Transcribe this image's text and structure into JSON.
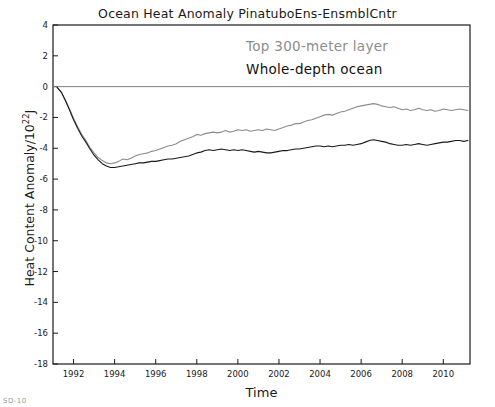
{
  "chart_data": {
    "type": "line",
    "title": "Ocean Heat Anomaly PinatuboEns-EnsmblCntr",
    "xlabel": "Time",
    "ylabel": "Heat Content Anomaly/10",
    "ylabel_exponent": "22",
    "ylabel_unit": "J",
    "xlim": [
      1991.0,
      2011.3
    ],
    "ylim": [
      -18,
      4
    ],
    "grid": false,
    "legend_position": "inside-upper-right-annotations",
    "xticks": [
      1992,
      1994,
      1996,
      1998,
      2000,
      2002,
      2004,
      2006,
      2008,
      2010
    ],
    "xtick_labels": [
      "1992",
      "1994",
      "1996",
      "1998",
      "2000",
      "2002",
      "2004",
      "2006",
      "2008",
      "2010"
    ],
    "yticks": [
      4,
      2,
      0,
      -2,
      -4,
      -6,
      -8,
      -10,
      -12,
      -14,
      -16,
      -18
    ],
    "ytick_labels": [
      "4",
      "2",
      "0",
      "-2",
      "-4",
      "-6",
      "-8",
      "-10",
      "-12",
      "-14",
      "-16",
      "-18"
    ],
    "zero_line": 0,
    "zero_line_color": "#808080",
    "annotations": [
      {
        "text": "Top 300-meter layer",
        "color": "#8c8c8c"
      },
      {
        "text": "Whole-depth ocean",
        "color": "#111111"
      }
    ],
    "series": [
      {
        "name": "Top 300-meter layer",
        "color": "#8c8c8c",
        "x": [
          1991.2,
          1991.4,
          1991.6,
          1991.8,
          1992.0,
          1992.2,
          1992.4,
          1992.6,
          1992.8,
          1993.0,
          1993.2,
          1993.4,
          1993.6,
          1993.8,
          1994.0,
          1994.2,
          1994.4,
          1994.6,
          1994.8,
          1995.0,
          1995.2,
          1995.4,
          1995.6,
          1995.8,
          1996.0,
          1996.2,
          1996.4,
          1996.6,
          1996.8,
          1997.0,
          1997.2,
          1997.4,
          1997.6,
          1997.8,
          1998.0,
          1998.2,
          1998.4,
          1998.6,
          1998.8,
          1999.0,
          1999.2,
          1999.4,
          1999.6,
          1999.8,
          2000.0,
          2000.2,
          2000.4,
          2000.6,
          2000.8,
          2001.0,
          2001.2,
          2001.4,
          2001.6,
          2001.8,
          2002.0,
          2002.2,
          2002.4,
          2002.6,
          2002.8,
          2003.0,
          2003.2,
          2003.4,
          2003.6,
          2003.8,
          2004.0,
          2004.2,
          2004.4,
          2004.6,
          2004.8,
          2005.0,
          2005.2,
          2005.4,
          2005.6,
          2005.8,
          2006.0,
          2006.2,
          2006.4,
          2006.6,
          2006.8,
          2007.0,
          2007.2,
          2007.4,
          2007.6,
          2007.8,
          2008.0,
          2008.2,
          2008.4,
          2008.6,
          2008.8,
          2009.0,
          2009.2,
          2009.4,
          2009.6,
          2009.8,
          2010.0,
          2010.2,
          2010.4,
          2010.6,
          2010.8,
          2011.0,
          2011.2
        ],
        "y": [
          -0.05,
          -0.35,
          -0.85,
          -1.45,
          -2.05,
          -2.6,
          -3.1,
          -3.5,
          -3.95,
          -4.3,
          -4.6,
          -4.8,
          -4.95,
          -5.0,
          -4.95,
          -4.85,
          -4.7,
          -4.75,
          -4.65,
          -4.5,
          -4.4,
          -4.35,
          -4.3,
          -4.2,
          -4.15,
          -4.05,
          -3.95,
          -3.85,
          -3.8,
          -3.7,
          -3.55,
          -3.45,
          -3.35,
          -3.25,
          -3.1,
          -3.15,
          -3.05,
          -3.0,
          -2.95,
          -3.0,
          -2.95,
          -2.85,
          -2.95,
          -2.9,
          -2.8,
          -2.85,
          -2.8,
          -2.9,
          -2.85,
          -2.8,
          -2.85,
          -2.75,
          -2.8,
          -2.85,
          -2.75,
          -2.65,
          -2.55,
          -2.5,
          -2.4,
          -2.4,
          -2.3,
          -2.2,
          -2.15,
          -2.05,
          -1.95,
          -1.85,
          -1.8,
          -1.85,
          -1.75,
          -1.65,
          -1.6,
          -1.5,
          -1.4,
          -1.3,
          -1.25,
          -1.2,
          -1.15,
          -1.1,
          -1.15,
          -1.25,
          -1.3,
          -1.35,
          -1.3,
          -1.4,
          -1.5,
          -1.45,
          -1.55,
          -1.5,
          -1.4,
          -1.5,
          -1.55,
          -1.5,
          -1.6,
          -1.55,
          -1.45,
          -1.5,
          -1.55,
          -1.5,
          -1.45,
          -1.5,
          -1.55
        ]
      },
      {
        "name": "Whole-depth ocean",
        "color": "#1a1a1a",
        "x": [
          1991.2,
          1991.4,
          1991.6,
          1991.8,
          1992.0,
          1992.2,
          1992.4,
          1992.6,
          1992.8,
          1993.0,
          1993.2,
          1993.4,
          1993.6,
          1993.8,
          1994.0,
          1994.2,
          1994.4,
          1994.6,
          1994.8,
          1995.0,
          1995.2,
          1995.4,
          1995.6,
          1995.8,
          1996.0,
          1996.2,
          1996.4,
          1996.6,
          1996.8,
          1997.0,
          1997.2,
          1997.4,
          1997.6,
          1997.8,
          1998.0,
          1998.2,
          1998.4,
          1998.6,
          1998.8,
          1999.0,
          1999.2,
          1999.4,
          1999.6,
          1999.8,
          2000.0,
          2000.2,
          2000.4,
          2000.6,
          2000.8,
          2001.0,
          2001.2,
          2001.4,
          2001.6,
          2001.8,
          2002.0,
          2002.2,
          2002.4,
          2002.6,
          2002.8,
          2003.0,
          2003.2,
          2003.4,
          2003.6,
          2003.8,
          2004.0,
          2004.2,
          2004.4,
          2004.6,
          2004.8,
          2005.0,
          2005.2,
          2005.4,
          2005.6,
          2005.8,
          2006.0,
          2006.2,
          2006.4,
          2006.6,
          2006.8,
          2007.0,
          2007.2,
          2007.4,
          2007.6,
          2007.8,
          2008.0,
          2008.2,
          2008.4,
          2008.6,
          2008.8,
          2009.0,
          2009.2,
          2009.4,
          2009.6,
          2009.8,
          2010.0,
          2010.2,
          2010.4,
          2010.6,
          2010.8,
          2011.0,
          2011.2
        ],
        "y": [
          -0.05,
          -0.35,
          -0.9,
          -1.5,
          -2.15,
          -2.7,
          -3.2,
          -3.6,
          -4.05,
          -4.45,
          -4.75,
          -5.0,
          -5.15,
          -5.25,
          -5.25,
          -5.2,
          -5.15,
          -5.1,
          -5.05,
          -5.0,
          -4.95,
          -4.95,
          -4.9,
          -4.85,
          -4.85,
          -4.8,
          -4.75,
          -4.7,
          -4.7,
          -4.65,
          -4.6,
          -4.55,
          -4.5,
          -4.4,
          -4.3,
          -4.25,
          -4.15,
          -4.1,
          -4.15,
          -4.1,
          -4.05,
          -4.1,
          -4.15,
          -4.1,
          -4.15,
          -4.1,
          -4.15,
          -4.2,
          -4.25,
          -4.2,
          -4.25,
          -4.3,
          -4.3,
          -4.25,
          -4.2,
          -4.15,
          -4.15,
          -4.1,
          -4.05,
          -4.05,
          -4.0,
          -3.95,
          -3.9,
          -3.85,
          -3.85,
          -3.9,
          -3.85,
          -3.9,
          -3.85,
          -3.8,
          -3.8,
          -3.75,
          -3.8,
          -3.75,
          -3.7,
          -3.6,
          -3.5,
          -3.45,
          -3.5,
          -3.55,
          -3.6,
          -3.7,
          -3.75,
          -3.8,
          -3.8,
          -3.75,
          -3.8,
          -3.75,
          -3.7,
          -3.75,
          -3.8,
          -3.75,
          -3.7,
          -3.65,
          -3.6,
          -3.6,
          -3.55,
          -3.5,
          -3.5,
          -3.55,
          -3.5
        ]
      }
    ]
  },
  "figure": {
    "corner_mark": "SD-10"
  }
}
